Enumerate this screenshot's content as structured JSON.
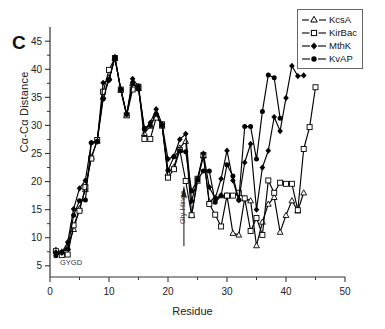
{
  "figure": {
    "panel_label": "C"
  },
  "annotations": [
    {
      "name": "gygd",
      "text": "GYGD"
    },
    {
      "name": "gly-hinge",
      "text": "Gly-Hinge"
    }
  ],
  "legend": {
    "position": "top-right",
    "entries": [
      {
        "label": "KcsA",
        "marker": "open-triangle",
        "color": "#000000"
      },
      {
        "label": "KirBac",
        "marker": "open-square",
        "color": "#000000"
      },
      {
        "label": "MthK",
        "marker": "filled-diamond",
        "color": "#000000"
      },
      {
        "label": "KvAP",
        "marker": "filled-circle",
        "color": "#000000"
      }
    ]
  },
  "chart_data": {
    "type": "line",
    "title": "",
    "xlabel": "Residue",
    "ylabel": "Cα-Cα Distance",
    "xlim": [
      0,
      50
    ],
    "ylim": [
      3,
      47
    ],
    "xticks": [
      0,
      10,
      20,
      30,
      40,
      50
    ],
    "yticks": [
      5,
      10,
      15,
      20,
      25,
      30,
      35,
      40,
      45
    ],
    "xminor_step": 5,
    "yminor_step": 2.5,
    "grid": false,
    "legend_position": "top-right",
    "series": [
      {
        "name": "KcsA",
        "marker": "open-triangle",
        "x": [
          1,
          2,
          3,
          4,
          5,
          6,
          7,
          8,
          9,
          10,
          11,
          12,
          13,
          14,
          15,
          16,
          17,
          18,
          19,
          20,
          21,
          22,
          23,
          24,
          25,
          26,
          27,
          28,
          29,
          30,
          31,
          32,
          33,
          34,
          35,
          36,
          37,
          38,
          39,
          40,
          41,
          42,
          43
        ],
        "values": [
          7.8,
          7.5,
          8.2,
          11.5,
          15.2,
          18.6,
          24.4,
          27.2,
          35.1,
          38.5,
          42.0,
          36.3,
          31.8,
          37.5,
          36.6,
          28.6,
          29.9,
          31.9,
          29.9,
          21.5,
          22.6,
          26.0,
          27.2,
          14.0,
          20.1,
          24.6,
          16.4,
          17.1,
          17.5,
          17.5,
          10.8,
          10.5,
          17.0,
          16.6,
          8.6,
          12.8,
          16.0,
          17.2,
          11.0,
          14.0,
          16.6,
          14.8,
          18.0
        ]
      },
      {
        "name": "KirBac",
        "marker": "open-square",
        "x": [
          1,
          2,
          3,
          4,
          5,
          6,
          7,
          8,
          9,
          10,
          11,
          12,
          13,
          14,
          15,
          16,
          17,
          18,
          19,
          20,
          21,
          22,
          23,
          24,
          25,
          26,
          27,
          28,
          29,
          30,
          31,
          32,
          33,
          34,
          35,
          36,
          37,
          38,
          39,
          40,
          41,
          42,
          43,
          44,
          45
        ],
        "values": [
          7.6,
          6.9,
          7.0,
          12.2,
          14.8,
          19.0,
          24.1,
          27.4,
          36.0,
          39.9,
          42.0,
          36.4,
          31.8,
          36.4,
          36.9,
          27.6,
          27.6,
          31.4,
          30.2,
          20.7,
          22.2,
          25.6,
          20.1,
          14.0,
          20.5,
          24.7,
          16.0,
          14.1,
          12.0,
          17.5,
          17.5,
          18.0,
          17.0,
          11.2,
          13.5,
          10.5,
          20.2,
          18.0,
          19.8,
          19.6,
          19.6,
          14.9,
          25.8,
          29.7,
          36.8
        ]
      },
      {
        "name": "MthK",
        "marker": "filled-diamond",
        "x": [
          1,
          2,
          3,
          4,
          5,
          6,
          7,
          8,
          9,
          10,
          11,
          12,
          13,
          14,
          15,
          16,
          17,
          18,
          19,
          20,
          21,
          22,
          23,
          24,
          25,
          26,
          27,
          28,
          29,
          30,
          31,
          32,
          33,
          34,
          35,
          36,
          37,
          38,
          39,
          40,
          41,
          42,
          43
        ],
        "values": [
          7.4,
          7.3,
          9.2,
          15.1,
          18.8,
          20.2,
          26.9,
          27.1,
          37.6,
          38.0,
          42.2,
          36.4,
          32.0,
          38.3,
          37.0,
          29.2,
          30.5,
          32.9,
          30.2,
          24.0,
          24.5,
          27.5,
          28.5,
          16.5,
          20.5,
          25.0,
          19.0,
          17.0,
          20.5,
          25.5,
          20.2,
          16.7,
          23.4,
          26.7,
          15.0,
          22.5,
          25.5,
          31.5,
          29.0,
          34.9,
          40.6,
          38.8,
          38.9
        ]
      },
      {
        "name": "KvAP",
        "marker": "filled-circle",
        "x": [
          1,
          2,
          3,
          4,
          5,
          6,
          7,
          8,
          9,
          10,
          11,
          12,
          13,
          14,
          15,
          16,
          17,
          18,
          19,
          20,
          21,
          22,
          23,
          24,
          25,
          26,
          27,
          28,
          29,
          30,
          31,
          32,
          33,
          34,
          35,
          36,
          37,
          38,
          39
        ],
        "values": [
          6.8,
          7.4,
          8.0,
          14.0,
          16.6,
          16.7,
          26.9,
          27.2,
          34.7,
          38.2,
          42.0,
          36.4,
          32.0,
          37.6,
          36.5,
          29.5,
          30.0,
          32.0,
          30.0,
          22.0,
          24.4,
          25.5,
          25.3,
          18.3,
          20.3,
          21.9,
          21.9,
          16.3,
          17.5,
          23.0,
          21.0,
          16.7,
          29.8,
          29.8,
          24.0,
          32.5,
          39.0,
          38.5,
          31.3
        ]
      }
    ]
  }
}
